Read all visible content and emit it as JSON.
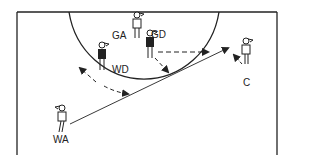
{
  "diagram": {
    "type": "netball court play diagram",
    "players": [
      {
        "label": "GA",
        "x": 137,
        "y": 28,
        "shirt": "light"
      },
      {
        "label": "GD",
        "x": 150,
        "y": 44,
        "shirt": "dark"
      },
      {
        "label": "WD",
        "x": 102,
        "y": 56,
        "shirt": "dark"
      },
      {
        "label": "C",
        "x": 246,
        "y": 50,
        "shirt": "light"
      },
      {
        "label": "WA",
        "x": 62,
        "y": 117,
        "shirt": "light"
      }
    ],
    "labels": {
      "ga": "GA",
      "gd": "GD",
      "wd": "WD",
      "c": "C",
      "wa": "WA"
    },
    "colors": {
      "line": "#222222",
      "background": "#ffffff"
    }
  }
}
